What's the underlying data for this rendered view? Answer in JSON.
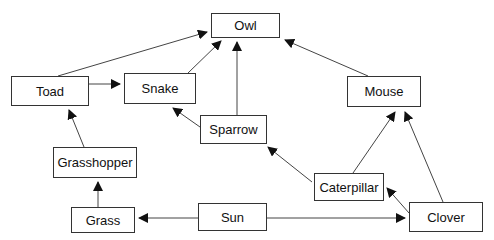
{
  "diagram": {
    "type": "food-web",
    "nodes": [
      {
        "id": "owl",
        "label": "Owl",
        "x": 211,
        "y": 13,
        "w": 69,
        "h": 25
      },
      {
        "id": "toad",
        "label": "Toad",
        "x": 11,
        "y": 76,
        "w": 78,
        "h": 30
      },
      {
        "id": "snake",
        "label": "Snake",
        "x": 124,
        "y": 73,
        "w": 72,
        "h": 31
      },
      {
        "id": "mouse",
        "label": "Mouse",
        "x": 347,
        "y": 76,
        "w": 74,
        "h": 31
      },
      {
        "id": "sparrow",
        "label": "Sparrow",
        "x": 200,
        "y": 115,
        "w": 67,
        "h": 29
      },
      {
        "id": "grasshopper",
        "label": "Grasshopper",
        "x": 53,
        "y": 147,
        "w": 84,
        "h": 31
      },
      {
        "id": "caterpillar",
        "label": "Caterpillar",
        "x": 314,
        "y": 173,
        "w": 70,
        "h": 28
      },
      {
        "id": "grass",
        "label": "Grass",
        "x": 71,
        "y": 207,
        "w": 64,
        "h": 26
      },
      {
        "id": "sun",
        "label": "Sun",
        "x": 198,
        "y": 203,
        "w": 69,
        "h": 28
      },
      {
        "id": "clover",
        "label": "Clover",
        "x": 409,
        "y": 202,
        "w": 74,
        "h": 30
      }
    ],
    "edges": [
      {
        "from": "toad",
        "to": "owl",
        "x1": 58,
        "y1": 76,
        "x2": 207,
        "y2": 32
      },
      {
        "from": "snake",
        "to": "owl",
        "x1": 188,
        "y1": 73,
        "x2": 221,
        "y2": 41
      },
      {
        "from": "sparrow",
        "to": "owl",
        "x1": 237,
        "y1": 115,
        "x2": 237,
        "y2": 42
      },
      {
        "from": "mouse",
        "to": "owl",
        "x1": 368,
        "y1": 76,
        "x2": 285,
        "y2": 40
      },
      {
        "from": "toad",
        "to": "snake",
        "x1": 89,
        "y1": 84,
        "x2": 120,
        "y2": 84
      },
      {
        "from": "sparrow",
        "to": "snake",
        "x1": 200,
        "y1": 127,
        "x2": 173,
        "y2": 108
      },
      {
        "from": "grasshopper",
        "to": "toad",
        "x1": 84,
        "y1": 147,
        "x2": 69,
        "y2": 110
      },
      {
        "from": "grass",
        "to": "grasshopper",
        "x1": 98,
        "y1": 207,
        "x2": 98,
        "y2": 182
      },
      {
        "from": "caterpillar",
        "to": "sparrow",
        "x1": 312,
        "y1": 182,
        "x2": 268,
        "y2": 147
      },
      {
        "from": "caterpillar",
        "to": "mouse",
        "x1": 353,
        "y1": 173,
        "x2": 395,
        "y2": 112
      },
      {
        "from": "clover",
        "to": "mouse",
        "x1": 443,
        "y1": 202,
        "x2": 405,
        "y2": 112
      },
      {
        "from": "clover",
        "to": "caterpillar",
        "x1": 409,
        "y1": 213,
        "x2": 387,
        "y2": 188
      },
      {
        "from": "sun",
        "to": "grass",
        "x1": 198,
        "y1": 218,
        "x2": 139,
        "y2": 218
      },
      {
        "from": "sun",
        "to": "clover",
        "x1": 267,
        "y1": 218,
        "x2": 405,
        "y2": 218
      }
    ],
    "colors": {
      "line": "#444444",
      "arrow": "#111111",
      "border": "#333333",
      "text": "#111111"
    }
  }
}
